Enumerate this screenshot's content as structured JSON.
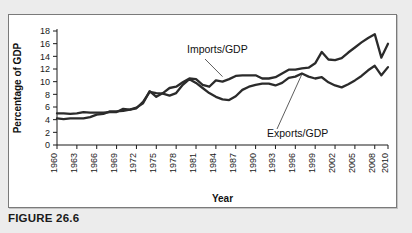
{
  "figure": {
    "caption": "FIGURE 26.6"
  },
  "chart_data": {
    "type": "line",
    "title": "",
    "xlabel": "Year",
    "ylabel": "Percentage of GDP",
    "xlim": [
      1960,
      2010
    ],
    "ylim": [
      0,
      18
    ],
    "ytick_step": 2,
    "yticks": [
      0,
      2,
      4,
      6,
      8,
      10,
      12,
      14,
      16,
      18
    ],
    "xticks": [
      1960,
      1963,
      1966,
      1969,
      1972,
      1975,
      1978,
      1981,
      1984,
      1987,
      1990,
      1993,
      1996,
      1999,
      2002,
      2005,
      2008,
      2010
    ],
    "grid": false,
    "legend_position": "inline-annotations",
    "annotations": [
      {
        "text": "Imports/GDP",
        "points_to_year": 1985,
        "points_to_value": 10.8
      },
      {
        "text": "Exports/GDP",
        "points_to_year": 1997,
        "points_to_value": 11.2
      }
    ],
    "x": [
      1960,
      1961,
      1962,
      1963,
      1964,
      1965,
      1966,
      1967,
      1968,
      1969,
      1970,
      1971,
      1972,
      1973,
      1974,
      1975,
      1976,
      1977,
      1978,
      1979,
      1980,
      1981,
      1982,
      1983,
      1984,
      1985,
      1986,
      1987,
      1988,
      1989,
      1990,
      1991,
      1992,
      1993,
      1994,
      1995,
      1996,
      1997,
      1998,
      1999,
      2000,
      2001,
      2002,
      2003,
      2004,
      2005,
      2006,
      2007,
      2008,
      2009,
      2010
    ],
    "series": [
      {
        "name": "Imports/GDP",
        "color": "#2b2b2b",
        "values": [
          4.2,
          4.1,
          4.2,
          4.2,
          4.2,
          4.4,
          4.8,
          4.9,
          5.3,
          5.3,
          5.4,
          5.6,
          5.9,
          6.6,
          8.5,
          7.6,
          8.2,
          9.0,
          9.2,
          9.9,
          10.5,
          10.4,
          9.5,
          9.2,
          10.2,
          10.0,
          10.4,
          10.9,
          11.0,
          11.0,
          11.0,
          10.5,
          10.5,
          10.7,
          11.3,
          11.9,
          11.9,
          12.1,
          12.2,
          12.9,
          14.7,
          13.5,
          13.4,
          13.7,
          14.6,
          15.4,
          16.2,
          16.9,
          17.5,
          13.8,
          16.0
        ]
      },
      {
        "name": "Exports/GDP",
        "color": "#2b2b2b",
        "values": [
          5.0,
          5.0,
          4.9,
          5.0,
          5.2,
          5.1,
          5.1,
          5.1,
          5.2,
          5.2,
          5.7,
          5.6,
          5.8,
          6.8,
          8.4,
          8.2,
          8.1,
          7.8,
          8.2,
          9.5,
          10.4,
          9.8,
          9.0,
          8.2,
          7.6,
          7.2,
          7.1,
          7.7,
          8.7,
          9.2,
          9.5,
          9.7,
          9.7,
          9.4,
          9.8,
          10.6,
          10.8,
          11.3,
          10.8,
          10.5,
          10.7,
          9.9,
          9.4,
          9.1,
          9.6,
          10.2,
          10.9,
          11.8,
          12.5,
          11.0,
          12.3
        ]
      }
    ]
  },
  "axis": {
    "y_title": "Percentage of GDP",
    "x_title": "Year"
  }
}
